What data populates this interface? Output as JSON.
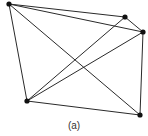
{
  "figure": {
    "caption": "(a)",
    "caption_pos": {
      "x": 74,
      "y": 129
    }
  },
  "graph": {
    "node_radius": 2.6,
    "colors": {
      "edge": "#2a2a2a",
      "node": "#111111",
      "background": "#ffffff"
    },
    "nodes": [
      {
        "id": "n1",
        "x": 9,
        "y": 4
      },
      {
        "id": "n2",
        "x": 125,
        "y": 17
      },
      {
        "id": "n3",
        "x": 143,
        "y": 32
      },
      {
        "id": "n4",
        "x": 27,
        "y": 101
      },
      {
        "id": "n5",
        "x": 140,
        "y": 115
      }
    ],
    "edges": [
      [
        "n1",
        "n2"
      ],
      [
        "n1",
        "n3"
      ],
      [
        "n1",
        "n4"
      ],
      [
        "n1",
        "n5"
      ],
      [
        "n2",
        "n3"
      ],
      [
        "n2",
        "n4"
      ],
      [
        "n3",
        "n4"
      ],
      [
        "n3",
        "n5"
      ],
      [
        "n4",
        "n5"
      ]
    ]
  }
}
